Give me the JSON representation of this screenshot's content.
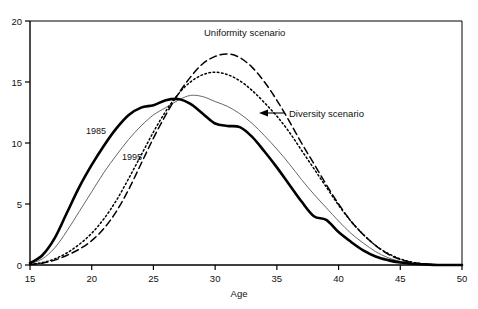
{
  "chart_data": {
    "type": "line",
    "title": "",
    "xlabel": "Age",
    "ylabel": "",
    "xlim": [
      15,
      50
    ],
    "ylim": [
      0,
      20
    ],
    "xticks": [
      15,
      20,
      25,
      30,
      35,
      40,
      45,
      50
    ],
    "yticks": [
      0,
      5,
      10,
      15,
      20
    ],
    "grid": false,
    "legend_position": "inline-annotations",
    "annotations": [
      {
        "text": "Uniformity scenario",
        "x": 31.0,
        "y": 19.0
      },
      {
        "text": "Diversity scenario",
        "x": 36.5,
        "y": 12.5
      },
      {
        "text": "1985",
        "x": 21.5,
        "y": 11.2
      },
      {
        "text": "1995",
        "x": 24.6,
        "y": 9.3
      }
    ],
    "x": [
      15,
      16,
      17,
      18,
      19,
      20,
      21,
      22,
      23,
      24,
      25,
      26,
      27,
      28,
      29,
      30,
      31,
      32,
      33,
      34,
      35,
      36,
      37,
      38,
      39,
      40,
      41,
      42,
      43,
      44,
      45,
      46,
      47,
      48,
      49,
      50
    ],
    "series": [
      {
        "name": "1985",
        "style": "thick-solid",
        "color": "#000000",
        "values": [
          0.15,
          0.8,
          2.2,
          4.3,
          6.4,
          8.2,
          9.8,
          11.2,
          12.3,
          12.9,
          13.1,
          13.5,
          13.6,
          13.2,
          12.4,
          11.6,
          11.4,
          11.3,
          10.5,
          9.3,
          8.0,
          6.6,
          5.2,
          4.0,
          3.7,
          2.7,
          1.9,
          1.2,
          0.7,
          0.4,
          0.2,
          0.1,
          0.05,
          0.0,
          0.0,
          0.0
        ]
      },
      {
        "name": "1995",
        "style": "thin-solid",
        "color": "#555555",
        "values": [
          0.1,
          0.5,
          1.4,
          2.8,
          4.4,
          6.0,
          7.6,
          9.0,
          10.3,
          11.4,
          12.3,
          12.9,
          13.5,
          13.9,
          13.8,
          13.4,
          13.0,
          12.4,
          11.6,
          10.6,
          9.5,
          8.3,
          7.0,
          5.8,
          4.7,
          3.6,
          2.6,
          1.8,
          1.1,
          0.6,
          0.3,
          0.12,
          0.04,
          0.0,
          0.0,
          0.0
        ]
      },
      {
        "name": "Uniformity scenario",
        "style": "dashed",
        "color": "#000000",
        "values": [
          0.05,
          0.15,
          0.4,
          0.8,
          1.3,
          2.0,
          3.0,
          4.4,
          6.2,
          8.3,
          10.4,
          12.3,
          14.0,
          15.4,
          16.5,
          17.1,
          17.3,
          17.0,
          16.2,
          15.0,
          13.5,
          11.8,
          10.0,
          8.3,
          6.6,
          5.0,
          3.6,
          2.5,
          1.6,
          0.9,
          0.45,
          0.2,
          0.07,
          0.0,
          0.0,
          0.0
        ]
      },
      {
        "name": "Diversity scenario",
        "style": "dotted",
        "color": "#000000",
        "values": [
          0.05,
          0.2,
          0.5,
          1.0,
          1.7,
          2.6,
          3.8,
          5.3,
          7.1,
          9.0,
          10.9,
          12.6,
          14.0,
          15.0,
          15.6,
          15.8,
          15.6,
          15.1,
          14.3,
          13.3,
          12.2,
          10.9,
          9.4,
          7.9,
          6.4,
          4.9,
          3.6,
          2.5,
          1.6,
          0.95,
          0.5,
          0.22,
          0.08,
          0.0,
          0.0,
          0.0
        ]
      }
    ]
  },
  "axis": {
    "x_title": "Age",
    "x_tick_labels": [
      "15",
      "20",
      "25",
      "30",
      "35",
      "40",
      "45",
      "50"
    ],
    "y_tick_labels": [
      "0",
      "5",
      "10",
      "15",
      "20"
    ]
  },
  "labels": {
    "uniformity": "Uniformity scenario",
    "diversity": "Diversity scenario",
    "year_1985": "1985",
    "year_1995": "1995"
  },
  "colors": {
    "axis": "#000000",
    "text": "#111111",
    "thick_line": "#000000",
    "thin_line": "#555555"
  }
}
